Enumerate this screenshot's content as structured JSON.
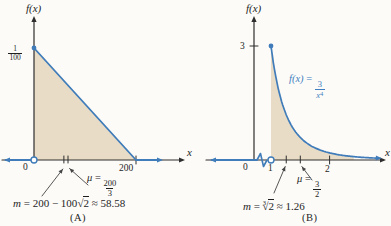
{
  "figure": {
    "background": "#fcfbf8"
  },
  "colors": {
    "curve_blue": "#3f7cb9",
    "label_blue": "#3f7fc1",
    "shade_tan": "#e8dcc6",
    "axis_dark": "#2e2e2e",
    "callout_gray": "#444444"
  },
  "chart_data": [
    {
      "id": "A",
      "type": "area",
      "description": "Triangular density: f(x) = (1/100)(1 - x/200) on [0,200], 0 elsewhere",
      "ylabel": "f(x)",
      "xlabel": "x",
      "domain": [
        0,
        200
      ],
      "y_intercept": {
        "value": 0.01,
        "num": "1",
        "den": "100"
      },
      "x_ticks": [
        {
          "v": 0,
          "label": "0"
        },
        {
          "v": 200,
          "label": "200"
        }
      ],
      "mean": {
        "value": 66.667,
        "symbol": "μ",
        "eq": "=",
        "frac_num": "200",
        "frac_den": "3"
      },
      "median": {
        "value": 58.58,
        "symbol": "m",
        "pre": "= 200 − 100",
        "radical": "√",
        "radicand": "2",
        "post": "≈ 58.58"
      },
      "caption": "(A)",
      "curve_points": [
        [
          0,
          0.01
        ],
        [
          200,
          0
        ]
      ],
      "ylim": [
        0,
        0.0125
      ]
    },
    {
      "id": "B",
      "type": "area",
      "description": "Density: f(x) = 3/x^4 for x >= 1, 0 for x < 1 (axis break between 0 and 1)",
      "ylabel": "f(x)",
      "xlabel": "x",
      "coef": 3,
      "exponent": 4,
      "domain_start": 1,
      "axis_break": true,
      "curve_label": {
        "fx": "f(x)",
        "eq": "=",
        "frac_num": "3",
        "frac_den_base": "x",
        "frac_den_exp": "4"
      },
      "y_ticks": [
        {
          "v": 3,
          "label": "3"
        }
      ],
      "x_ticks": [
        {
          "v": 0,
          "label": "0"
        },
        {
          "v": 1,
          "label": "1"
        },
        {
          "v": 2,
          "label": "2"
        }
      ],
      "mean": {
        "value": 1.5,
        "symbol": "μ",
        "eq": "=",
        "frac_num": "3",
        "frac_den": "2"
      },
      "median": {
        "value": 1.26,
        "symbol": "m",
        "pre": "=",
        "root_index": "3",
        "radical": "√",
        "radicand": "2",
        "post": "≈ 1.26"
      },
      "caption": "(B)",
      "ylim": [
        0,
        3.6
      ]
    }
  ]
}
